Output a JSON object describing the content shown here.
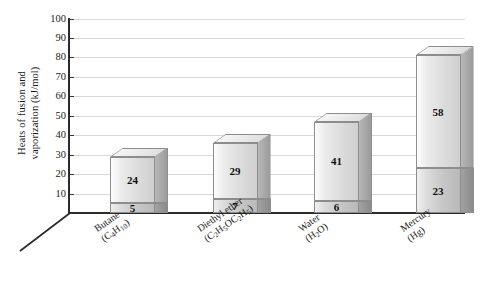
{
  "chart_data": {
    "type": "bar",
    "subtype": "stacked-3d-column",
    "title": "",
    "xlabel": "",
    "ylabel": "Heats of fusion and vaporization (kJ/mol)",
    "ylabel_line1": "Heats of fusion and",
    "ylabel_line2": "vaporization (kJ/mol)",
    "ylim": [
      0,
      100
    ],
    "ytick_step": 10,
    "yticks": [
      100,
      90,
      80,
      70,
      60,
      50,
      40,
      30,
      20,
      10
    ],
    "grid": true,
    "legend": "none",
    "categories": [
      "Butane (C4H10)",
      "Diethyl ether (C2H5OC2H5)",
      "Water (H2O)",
      "Mercury (Hg)"
    ],
    "series": [
      {
        "name": "Heat of fusion",
        "values": [
          5,
          7,
          6,
          23
        ]
      },
      {
        "name": "Heat of vaporization",
        "values": [
          24,
          29,
          41,
          58
        ]
      }
    ],
    "totals": [
      29,
      36,
      47,
      81
    ],
    "bars": [
      {
        "category": "Butane",
        "formula_plain": "(C4H10)",
        "label_line1": "Butane",
        "fusion": 5,
        "vaporization": 24,
        "total": 29,
        "fusion_label": "5",
        "vaporization_label": "24"
      },
      {
        "category": "Diethyl ether",
        "formula_plain": "(C2H5OC2H5)",
        "label_line1": "Diethyl ether",
        "fusion": 7,
        "vaporization": 29,
        "total": 36,
        "fusion_label": "7",
        "vaporization_label": "29"
      },
      {
        "category": "Water",
        "formula_plain": "(H2O)",
        "label_line1": "Water",
        "fusion": 6,
        "vaporization": 41,
        "total": 47,
        "fusion_label": "6",
        "vaporization_label": "41"
      },
      {
        "category": "Mercury",
        "formula_plain": "(Hg)",
        "label_line1": "Mercury",
        "fusion": 23,
        "vaporization": 58,
        "total": 81,
        "fusion_label": "23",
        "vaporization_label": "58"
      }
    ],
    "colors": {
      "background": "#ffffff",
      "gridline": "#d8d8d8",
      "axis": "#2b2b2b",
      "bar_upper_face": "#e4e4e4",
      "bar_lower_face": "#cccccc",
      "bar_side": "#a8a8a8",
      "bar_top": "#e9e9e9",
      "bar_outline": "#8d8d8d",
      "text": "#1a1a1a"
    }
  }
}
